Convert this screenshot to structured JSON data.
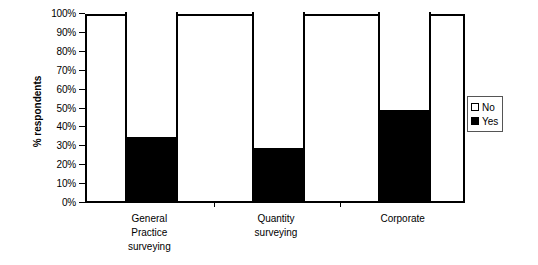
{
  "chart_data": {
    "type": "bar",
    "subtype": "100% stacked bar",
    "title": "",
    "xlabel": "",
    "ylabel": "% respondents",
    "ylim": [
      0,
      100
    ],
    "yticks": [
      "0%",
      "10%",
      "20%",
      "30%",
      "40%",
      "50%",
      "60%",
      "70%",
      "80%",
      "90%",
      "100%"
    ],
    "ytick_values": [
      0,
      10,
      20,
      30,
      40,
      50,
      60,
      70,
      80,
      90,
      100
    ],
    "grid": false,
    "legend_position": "right",
    "categories": [
      "General Practice surveying",
      "Quantity surveying",
      "Corporate"
    ],
    "category_lines": [
      [
        "General",
        "Practice",
        "surveying"
      ],
      [
        "Quantity",
        "surveying"
      ],
      [
        "Corporate"
      ]
    ],
    "series": [
      {
        "name": "No",
        "color": "#ffffff",
        "values": [
          66,
          72,
          52
        ]
      },
      {
        "name": "Yes",
        "color": "#000000",
        "values": [
          34,
          28,
          48
        ]
      }
    ]
  },
  "legend": {
    "items": [
      {
        "label": "No",
        "swatch": "hollow-square"
      },
      {
        "label": "Yes",
        "swatch": "filled-square"
      }
    ]
  },
  "axis": {
    "y_title": "% respondents"
  },
  "colors": {
    "yes": "#000000",
    "no": "#ffffff",
    "axis": "#000000",
    "background": "#ffffff"
  }
}
